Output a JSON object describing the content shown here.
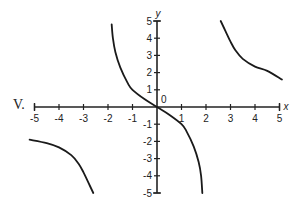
{
  "problem_label": "V.",
  "chart_data": {
    "type": "line",
    "title": "",
    "xlabel": "x",
    "ylabel": "y",
    "xlim": [
      -5,
      5
    ],
    "ylim": [
      -5,
      5
    ],
    "grid": false,
    "legend": null,
    "origin_label": "0",
    "x_ticks": [
      -5,
      -4,
      -3,
      -2,
      -1,
      1,
      2,
      3,
      4,
      5
    ],
    "y_ticks": [
      5,
      4,
      3,
      2,
      1,
      -1,
      -2,
      -3,
      -4,
      -5
    ],
    "x_tick_labels": [
      "-5",
      "-4",
      "-3",
      "-2",
      "-1",
      "1",
      "2",
      "3",
      "4",
      "5"
    ],
    "y_tick_labels": [
      "5",
      "4",
      "3",
      "2",
      "1",
      "-1",
      "-2",
      "-3",
      "-4",
      "-5"
    ],
    "annotations": [
      "vertical asymptotes near x = -2 and x = 2"
    ],
    "series": [
      {
        "name": "left branch",
        "x": [
          -5.2,
          -4.5,
          -4.0,
          -3.5,
          -3.2,
          -3.0,
          -2.8,
          -2.6
        ],
        "y": [
          -1.9,
          -2.1,
          -2.35,
          -2.8,
          -3.3,
          -3.8,
          -4.4,
          -5.0
        ]
      },
      {
        "name": "middle branch",
        "x": [
          -1.85,
          -1.8,
          -1.7,
          -1.5,
          -1.2,
          -1.0,
          -0.5,
          0.0,
          0.5,
          1.0,
          1.2,
          1.5,
          1.7,
          1.8,
          1.85
        ],
        "y": [
          4.8,
          4.0,
          3.2,
          2.3,
          1.4,
          1.0,
          0.45,
          0.0,
          -0.45,
          -1.0,
          -1.4,
          -2.3,
          -3.2,
          -4.0,
          -5.0
        ]
      },
      {
        "name": "right branch",
        "x": [
          2.6,
          2.8,
          3.0,
          3.2,
          3.5,
          4.0,
          4.5,
          5.1
        ],
        "y": [
          5.0,
          4.4,
          3.8,
          3.3,
          2.8,
          2.35,
          2.1,
          1.6
        ]
      }
    ]
  },
  "axes": {
    "x_label": "x",
    "y_label": "y",
    "origin_label": "0"
  }
}
